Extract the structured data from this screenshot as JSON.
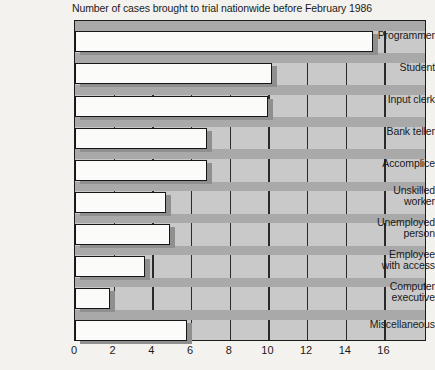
{
  "chart_data": {
    "type": "bar",
    "orientation": "horizontal",
    "title": "Number of cases brought to trial nationwide before February 1986",
    "xlabel": "",
    "ylabel": "",
    "xlim": [
      0,
      18.2
    ],
    "xticks": [
      0,
      2,
      4,
      6,
      8,
      10,
      12,
      14,
      16
    ],
    "xtick_labels": [
      "0",
      "2",
      "4",
      "6",
      "8",
      "10",
      "12",
      "14",
      "16"
    ],
    "grid": "vertical",
    "legend": "none",
    "categories": [
      "Programmer",
      "Student",
      "Input clerk",
      "Bank teller",
      "Accomplice",
      "Unskilled worker",
      "Unemployed person",
      "Employee with access",
      "Computer executive",
      "Miscellaneous"
    ],
    "category_label_lines": [
      [
        "Programmer"
      ],
      [
        "Student"
      ],
      [
        "Input clerk"
      ],
      [
        "Bank teller"
      ],
      [
        "Accomplice"
      ],
      [
        "Unskilled",
        "worker"
      ],
      [
        "Unemployed",
        "person"
      ],
      [
        "Employee",
        "with access"
      ],
      [
        "Computer",
        "executive"
      ],
      [
        "Miscellaneous"
      ]
    ],
    "values": [
      15.4,
      10.2,
      10.0,
      6.8,
      6.8,
      4.7,
      4.9,
      3.6,
      1.8,
      5.8
    ],
    "colors": {
      "background": "#f4f2ee",
      "plot_background": "#c9c9c9",
      "bar_fill": "#fbfbf9",
      "bar_outline": "#161616",
      "bar_shadow": "#8f8f8f",
      "gridline": "#2a2a2a",
      "row_band": "#a9a9a9",
      "text": "#1a1a1a"
    }
  }
}
